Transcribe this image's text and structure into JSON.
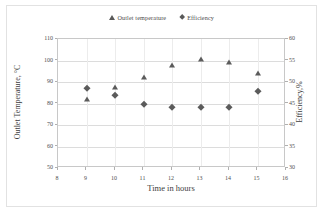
{
  "chart_data": {
    "type": "scatter",
    "title": "",
    "xlabel": "Time in hours",
    "ylabel": "Outlet Temperature, °C",
    "y2label": "Efficiency,%",
    "xlim": [
      8,
      16
    ],
    "ylim": [
      50,
      110
    ],
    "y2lim": [
      30,
      60
    ],
    "xticks": [
      "8",
      "9",
      "10",
      "11",
      "12",
      "13",
      "14",
      "15",
      "16"
    ],
    "yticks": [
      "50",
      "60",
      "70",
      "80",
      "90",
      "100",
      "110"
    ],
    "y2ticks": [
      "30",
      "35",
      "40",
      "45",
      "50",
      "55",
      "60"
    ],
    "grid": "horizontal",
    "legend_position": "top-center",
    "x": [
      9,
      10,
      11,
      12,
      13,
      14,
      15
    ],
    "series": [
      {
        "name": "Outlet temperature",
        "marker": "triangle",
        "color": "#5b5b5b",
        "axis": "left",
        "values": [
          82,
          87.5,
          92.5,
          98,
          100.5,
          99.5,
          94
        ]
      },
      {
        "name": "Efficiency",
        "marker": "diamond",
        "color": "#5b5b5b",
        "axis": "right",
        "values": [
          48.5,
          47,
          45,
          44.3,
          44.3,
          44.3,
          48
        ]
      }
    ]
  },
  "legend": {
    "entries": [
      {
        "label": "Outlet temperature",
        "marker": "triangle-marker-icon"
      },
      {
        "label": "Efficiency",
        "marker": "diamond-marker-icon"
      }
    ]
  },
  "colors": {
    "marker": "#5b5b5b",
    "gridline": "#dcdcdc",
    "axis": "#c8c8c8",
    "text": "#4f4f4f"
  }
}
